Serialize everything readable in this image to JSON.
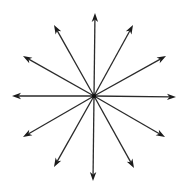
{
  "diagram": {
    "type": "radial-arrows",
    "center": {
      "x": 94,
      "y": 96
    },
    "stroke_color": "#2a2a2a",
    "head_color": "#1a1a1a",
    "background": "#ffffff",
    "center_dot_color": "#111111",
    "arrows": [
      {
        "angle_deg": 0,
        "tip": {
          "x": 176,
          "y": 97
        }
      },
      {
        "angle_deg": 30,
        "tip": {
          "x": 166,
          "y": 56
        }
      },
      {
        "angle_deg": 60,
        "tip": {
          "x": 133,
          "y": 25
        }
      },
      {
        "angle_deg": 90,
        "tip": {
          "x": 95,
          "y": 13
        }
      },
      {
        "angle_deg": 120,
        "tip": {
          "x": 54,
          "y": 25
        }
      },
      {
        "angle_deg": 150,
        "tip": {
          "x": 23,
          "y": 56
        }
      },
      {
        "angle_deg": 180,
        "tip": {
          "x": 12,
          "y": 96
        }
      },
      {
        "angle_deg": 210,
        "tip": {
          "x": 23,
          "y": 137
        }
      },
      {
        "angle_deg": 240,
        "tip": {
          "x": 54,
          "y": 167
        }
      },
      {
        "angle_deg": 270,
        "tip": {
          "x": 93,
          "y": 181
        }
      },
      {
        "angle_deg": 300,
        "tip": {
          "x": 134,
          "y": 168
        }
      },
      {
        "angle_deg": 330,
        "tip": {
          "x": 165,
          "y": 137
        }
      }
    ],
    "arrow_count": 12
  }
}
